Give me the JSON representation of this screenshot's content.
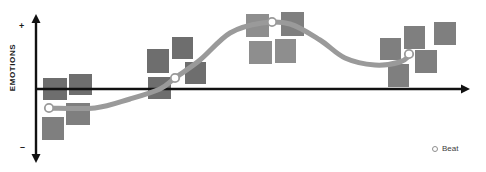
{
  "diagram": {
    "y_axis_label": "EMOTIONS",
    "y_axis_positive_symbol": "+",
    "y_axis_negative_symbol": "–"
  },
  "legend": {
    "position": "bottom-right",
    "items": [
      {
        "marker": "hollow-circle",
        "label": "Beat"
      }
    ]
  },
  "colors": {
    "background": "#ffffff",
    "axis": "#111111",
    "curve": "#9a9a9a",
    "card_light": "#8e8e8e",
    "card_mid": "#7f7f7f",
    "card_dark": "#6e6e6e",
    "beat_marker_stroke": "#9a9a9a",
    "beat_marker_fill": "#ffffff",
    "text": "#1a1a1a"
  },
  "chart_data": {
    "type": "line",
    "xlabel": "",
    "ylabel": "EMOTIONS",
    "grid": false,
    "legend_position": "bottom-right",
    "axes": {
      "x_axis_y_pixel": 89,
      "x_axis_start_x": 36,
      "x_axis_end_x": 470,
      "y_axis_x_pixel": 36,
      "y_axis_top_y": 14,
      "y_axis_bottom_y": 163,
      "x_arrow": true,
      "y_arrow_both_ends": true
    },
    "ylim": [
      -1,
      1
    ],
    "series": [
      {
        "name": "Emotional arc",
        "type": "curve",
        "stroke": "#9a9a9a",
        "stroke_width": 5,
        "points": [
          {
            "x": 49,
            "y": 108
          },
          {
            "x": 95,
            "y": 108
          },
          {
            "x": 130,
            "y": 99
          },
          {
            "x": 160,
            "y": 89
          },
          {
            "x": 175,
            "y": 78
          },
          {
            "x": 200,
            "y": 60
          },
          {
            "x": 230,
            "y": 33
          },
          {
            "x": 262,
            "y": 23
          },
          {
            "x": 290,
            "y": 24
          },
          {
            "x": 320,
            "y": 40
          },
          {
            "x": 345,
            "y": 58
          },
          {
            "x": 375,
            "y": 65
          },
          {
            "x": 400,
            "y": 62
          },
          {
            "x": 410,
            "y": 55
          }
        ]
      }
    ],
    "beats": [
      {
        "index": 1,
        "label": "Beat",
        "x": 49,
        "y": 108,
        "value": -0.25
      },
      {
        "index": 2,
        "label": "Beat",
        "x": 175,
        "y": 78,
        "value": 0.15
      },
      {
        "index": 3,
        "label": "Beat",
        "x": 272,
        "y": 22,
        "value": 0.9
      },
      {
        "index": 4,
        "label": "Beat",
        "x": 409,
        "y": 54,
        "value": 0.47
      }
    ],
    "cards": [
      {
        "id": 1,
        "x": 43,
        "y": 78,
        "w": 24,
        "h": 22,
        "shade": "card_dark"
      },
      {
        "id": 2,
        "x": 69,
        "y": 74,
        "w": 23,
        "h": 21,
        "shade": "card_dark"
      },
      {
        "id": 3,
        "x": 66,
        "y": 103,
        "w": 24,
        "h": 22,
        "shade": "card_mid"
      },
      {
        "id": 4,
        "x": 42,
        "y": 117,
        "w": 22,
        "h": 23,
        "shade": "card_mid"
      },
      {
        "id": 5,
        "x": 147,
        "y": 49,
        "w": 22,
        "h": 24,
        "shade": "card_dark"
      },
      {
        "id": 6,
        "x": 172,
        "y": 37,
        "w": 21,
        "h": 22,
        "shade": "card_dark"
      },
      {
        "id": 7,
        "x": 148,
        "y": 77,
        "w": 23,
        "h": 22,
        "shade": "card_dark"
      },
      {
        "id": 8,
        "x": 185,
        "y": 62,
        "w": 21,
        "h": 22,
        "shade": "card_dark"
      },
      {
        "id": 9,
        "x": 246,
        "y": 14,
        "w": 23,
        "h": 23,
        "shade": "card_light"
      },
      {
        "id": 10,
        "x": 281,
        "y": 12,
        "w": 23,
        "h": 24,
        "shade": "card_mid"
      },
      {
        "id": 11,
        "x": 249,
        "y": 41,
        "w": 23,
        "h": 23,
        "shade": "card_light"
      },
      {
        "id": 12,
        "x": 275,
        "y": 39,
        "w": 21,
        "h": 24,
        "shade": "card_light"
      },
      {
        "id": 13,
        "x": 380,
        "y": 38,
        "w": 21,
        "h": 22,
        "shade": "card_mid"
      },
      {
        "id": 14,
        "x": 404,
        "y": 26,
        "w": 21,
        "h": 23,
        "shade": "card_mid"
      },
      {
        "id": 15,
        "x": 388,
        "y": 64,
        "w": 21,
        "h": 23,
        "shade": "card_mid"
      },
      {
        "id": 16,
        "x": 415,
        "y": 50,
        "w": 22,
        "h": 23,
        "shade": "card_mid"
      },
      {
        "id": 17,
        "x": 434,
        "y": 22,
        "w": 22,
        "h": 23,
        "shade": "card_mid"
      }
    ]
  }
}
